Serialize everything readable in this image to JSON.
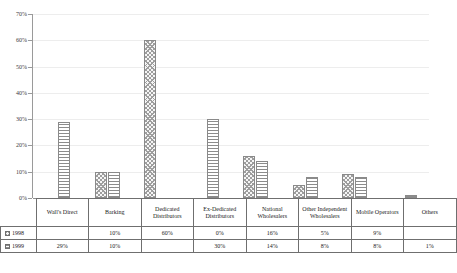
{
  "chart_data": {
    "type": "bar",
    "title": "",
    "xlabel": "",
    "ylabel": "",
    "ylim": [
      0,
      70
    ],
    "ytick_labels": [
      "70%",
      "60%",
      "50%",
      "40%",
      "30%",
      "20%",
      "10%",
      "0%"
    ],
    "ytick_values": [
      70,
      60,
      50,
      40,
      30,
      20,
      10,
      0
    ],
    "grid": true,
    "legend_position": "table-below",
    "categories": [
      "Wall's Direct",
      "Barking",
      "Dedicated Distributors",
      "Ex-Dedicated Distributors",
      "National Wholesalers",
      "Other Independent Wholesalers",
      "Mobile Operators",
      "Others"
    ],
    "series": [
      {
        "name": "1998",
        "pattern": "checkered",
        "values": [
          null,
          10,
          60,
          0,
          16,
          5,
          9,
          null
        ],
        "labels": [
          "",
          "10%",
          "60%",
          "0%",
          "16%",
          "5%",
          "9%",
          ""
        ]
      },
      {
        "name": "1999",
        "pattern": "horizontal-lines",
        "values": [
          29,
          10,
          null,
          30,
          14,
          8,
          8,
          1
        ],
        "labels": [
          "29%",
          "10%",
          "",
          "30%",
          "14%",
          "8%",
          "8%",
          "1%"
        ]
      }
    ]
  },
  "table": {
    "row_headers": [
      "1998",
      "1999"
    ]
  }
}
